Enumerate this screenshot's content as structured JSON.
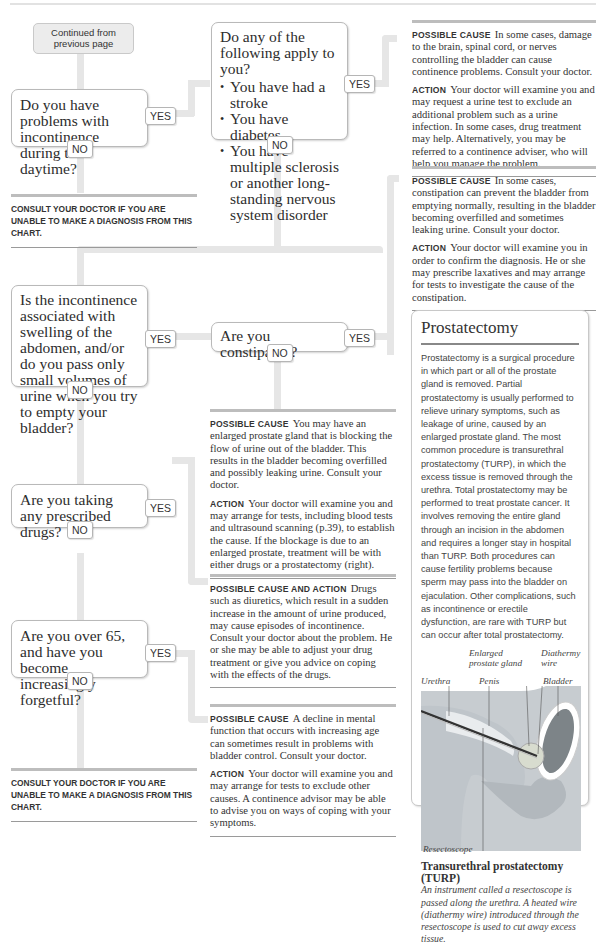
{
  "chart_header": {
    "continued": "Continued from previous page"
  },
  "questions": [
    {
      "id": "q1",
      "text": "Do you have problems with incontinence during the daytime?",
      "yes": "YES",
      "no": "NO"
    },
    {
      "id": "q2",
      "intro": "Do any of the following apply to you?",
      "bullets": [
        "You have had a stroke",
        "You have diabetes",
        "You have multiple sclerosis or another long-standing nervous system disorder"
      ],
      "yes": "YES",
      "no": "NO"
    },
    {
      "id": "q3",
      "text": "Is the incontinence associated with swelling of the abdomen, and/or do you pass only small volumes of urine when you try to empty your bladder?",
      "yes": "YES",
      "no": "NO"
    },
    {
      "id": "q4",
      "text": "Are you constipated?",
      "yes": "YES",
      "no": "NO"
    },
    {
      "id": "q5",
      "text": "Are you taking any prescribed drugs?",
      "yes": "YES",
      "no": "NO"
    },
    {
      "id": "q6",
      "text": "Are you over 65, and have you become increasingly forgetful?",
      "yes": "YES",
      "no": "NO"
    }
  ],
  "consult_notes": [
    "Consult your doctor if you are unable to make a diagnosis from this chart.",
    "Consult your doctor if you are unable to make a diagnosis from this chart."
  ],
  "results": [
    {
      "cause_label": "Possible cause",
      "cause": "In some cases, damage to the brain, spinal cord, or nerves controlling the bladder can cause continence problems. Consult your doctor.",
      "action_label": "Action",
      "action": "Your doctor will examine you and may request a urine test to exclude an additional problem such as a urine infection. In some cases, drug treatment may help. Alternatively, you may be referred to a continence adviser, who will help you manage the problem."
    },
    {
      "cause_label": "Possible cause",
      "cause": "In some cases, constipation can prevent the bladder from emptying normally, resulting in the bladder becoming overfilled and sometimes leaking urine. Consult your doctor.",
      "action_label": "Action",
      "action": "Your doctor will examine you in order to confirm the diagnosis. He or she may prescribe laxatives and may arrange for tests to investigate the cause of the constipation."
    },
    {
      "cause_label": "Possible cause",
      "cause": "You may have an enlarged prostate gland that is blocking the flow of urine out of the bladder. This results in the bladder becoming overfilled and possibly leaking urine. Consult your doctor.",
      "action_label": "Action",
      "action": "Your doctor will examine you and may arrange for tests, including blood tests and ultrasound scanning (p.39), to establish the cause. If the blockage is due to an enlarged prostate, treatment will be with either drugs or a prostatectomy (right)."
    },
    {
      "cause_label": "Possible cause and action",
      "cause": "Drugs such as diuretics, which result in a sudden increase in the amount of urine produced, may cause episodes of incontinence. Consult your doctor about the problem. He or she may be able to adjust your drug treatment or give you advice on coping with the effects of the drugs."
    },
    {
      "cause_label": "Possible cause",
      "cause": "A decline in mental function that occurs with increasing age can sometimes result in problems with bladder control. Consult your doctor.",
      "action_label": "Action",
      "action": "Your doctor will examine you and may arrange for tests to exclude other causes. A continence advisor may be able to advise you on ways of coping with your symptoms."
    }
  ],
  "sidebar": {
    "title": "Prostatectomy",
    "body": "Prostatectomy is a surgical procedure in which part or all of the prostate gland is removed. Partial prostatectomy is usually performed to relieve urinary symptoms, such as leakage of urine, caused by an enlarged prostate gland. The most common procedure is transurethral prostatectomy (TURP), in which the excess tissue is removed through the urethra. Total prostatectomy may be performed to treat prostate cancer. It involves removing the entire gland through an incision in the abdomen and requires a longer stay in hospital than TURP. Both procedures can cause fertility problems because sperm may pass into the bladder on ejaculation. Other complications, such as incontinence or erectile dysfunction, are rare with TURP but can occur after total prostatectomy.",
    "figure_labels": {
      "enlarged_prostate": "Enlarged prostate gland",
      "diathermy_wire": "Diathermy wire",
      "urethra": "Urethra",
      "penis": "Penis",
      "bladder": "Bladder",
      "resectoscope": "Resectoscope"
    },
    "caption_title": "Transurethral prostatectomy (TURP)",
    "caption_text": "An instrument called a resectoscope is passed along the urethra. A heated wire (diathermy wire) introduced through the resectoscope is used to cut away excess tissue."
  }
}
